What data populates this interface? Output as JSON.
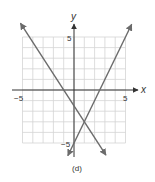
{
  "figure": {
    "caption": "(d)",
    "x_axis_label": "x",
    "y_axis_label": "y",
    "tick_labels": {
      "x_min": "−5",
      "x_max": "5",
      "y_max": "5",
      "y_min": "−5"
    }
  },
  "colors": {
    "grid": "#d4d4d4",
    "axis": "#333333",
    "line": "#6b6b6b"
  },
  "chart_data": {
    "type": "line",
    "title": "",
    "caption": "(d)",
    "xlabel": "x",
    "ylabel": "y",
    "xlim": [
      -5,
      5
    ],
    "ylim": [
      -5,
      5
    ],
    "grid": true,
    "grid_step": 1,
    "tick_labels": {
      "x": [
        "−5",
        "5"
      ],
      "y": [
        "5",
        "−5"
      ]
    },
    "legend": null,
    "series": [
      {
        "name": "line 1 (decreasing)",
        "equation": "y = -1.5x - 1.5",
        "slope": -1.5,
        "y_intercept": -1.5,
        "x_intercept": -1,
        "x": [
          -5.2,
          3.1
        ],
        "y": [
          6.3,
          -6.15
        ],
        "arrows": "both ends"
      },
      {
        "name": "line 2 (increasing)",
        "equation": "y = 2x - 5",
        "slope": 2,
        "y_intercept": -5,
        "x_intercept": 2.5,
        "x": [
          -0.6,
          5.6
        ],
        "y": [
          -6.2,
          6.2
        ],
        "arrows": "both ends"
      }
    ],
    "intersection": {
      "x": 1,
      "y": -3
    }
  }
}
